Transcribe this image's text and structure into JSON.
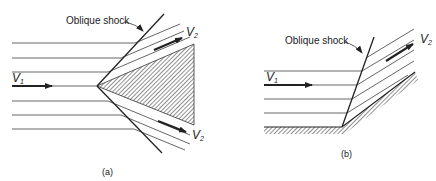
{
  "panel_a": {
    "shock_label": "Oblique shock",
    "v1": "V",
    "v1_sub": "1",
    "v2_upper": "V",
    "v2_upper_sub": "2",
    "v2_lower": "V",
    "v2_lower_sub": "2",
    "caption": "(a)"
  },
  "panel_b": {
    "shock_label": "Oblique shock",
    "v1": "V",
    "v1_sub": "1",
    "v2": "V",
    "v2_sub": "2",
    "caption": "(b)"
  },
  "colors": {
    "line": "#444444",
    "shock": "#222222",
    "arrow": "#222222",
    "hatch": "#333333"
  }
}
